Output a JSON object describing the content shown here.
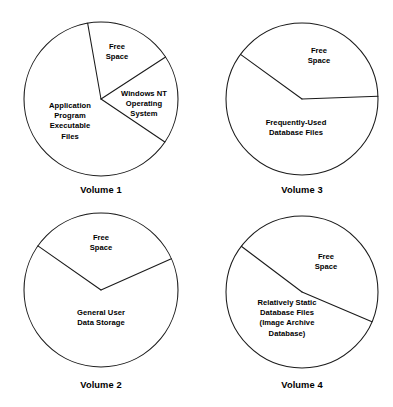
{
  "figure": {
    "title": "",
    "background_color": "#ffffff",
    "line_color": "#1a1a1a",
    "text_color": "#000000"
  },
  "chart_data": {
    "type": "pie",
    "title": "",
    "xlabel": "",
    "ylabel": "",
    "legend_position": "none",
    "grid": false,
    "note": "Four unfilled (outline only) pie charts showing disk volume allocation. Angles measured clockwise from 12 o'clock.",
    "charts": [
      {
        "id": "volume-1",
        "caption": "Volume 1",
        "center": [
          101,
          99
        ],
        "radius": 77,
        "caption_pos": [
          101,
          190
        ],
        "slices": [
          {
            "label": "Free\nSpace",
            "label_lines": [
              "Free",
              "Space"
            ],
            "start_angle_deg": 350,
            "end_angle_deg": 57,
            "percent": 19,
            "label_pos": [
              117,
              52
            ]
          },
          {
            "label": "Windows NT\nOperating\nSystem",
            "label_lines": [
              "Windows NT",
              "Operating",
              "System"
            ],
            "start_angle_deg": 57,
            "end_angle_deg": 124,
            "percent": 19,
            "label_pos": [
              144,
              104
            ]
          },
          {
            "label": "Application\nProgram\nExecutable\nFiles",
            "label_lines": [
              "Application",
              "Program",
              "Executable",
              "Files"
            ],
            "start_angle_deg": 124,
            "end_angle_deg": 350,
            "percent": 62,
            "label_pos": [
              70,
              121
            ]
          }
        ]
      },
      {
        "id": "volume-2",
        "caption": "Volume 2",
        "center": [
          101,
          290
        ],
        "radius": 77,
        "caption_pos": [
          101,
          385
        ],
        "slices": [
          {
            "label": "Free\nSpace",
            "label_lines": [
              "Free",
              "Space"
            ],
            "start_angle_deg": 305,
            "end_angle_deg": 66,
            "percent": 34,
            "label_pos": [
              101,
              243
            ]
          },
          {
            "label": "General User\nData Storage",
            "label_lines": [
              "General User",
              "Data Storage"
            ],
            "start_angle_deg": 66,
            "end_angle_deg": 305,
            "percent": 66,
            "label_pos": [
              101,
              318
            ]
          }
        ]
      },
      {
        "id": "volume-3",
        "caption": "Volume 3",
        "center": [
          302,
          99
        ],
        "radius": 76,
        "caption_pos": [
          302,
          190
        ],
        "slices": [
          {
            "label": "Free\nSpace",
            "label_lines": [
              "Free",
              "Space"
            ],
            "start_angle_deg": 306,
            "end_angle_deg": 88,
            "percent": 39,
            "label_pos": [
              319,
              56
            ]
          },
          {
            "label": "Frequently-Used\nDatabase Files",
            "label_lines": [
              "Frequently-Used",
              "Database Files"
            ],
            "start_angle_deg": 88,
            "end_angle_deg": 306,
            "percent": 61,
            "label_pos": [
              296,
              128
            ]
          }
        ]
      },
      {
        "id": "volume-4",
        "caption": "Volume 4",
        "center": [
          302,
          292
        ],
        "radius": 76,
        "caption_pos": [
          302,
          385
        ],
        "slices": [
          {
            "label": "Free\nSpace",
            "label_lines": [
              "Free",
              "Space"
            ],
            "start_angle_deg": 307,
            "end_angle_deg": 113,
            "percent": 52,
            "label_pos": [
              326,
              262
            ]
          },
          {
            "label": "Relatively Static\nDatabase Files\n(Image Archive\nDatabase)",
            "label_lines": [
              "Relatively Static",
              "Database Files",
              "(Image Archive",
              "Database)"
            ],
            "start_angle_deg": 113,
            "end_angle_deg": 307,
            "percent": 48,
            "label_pos": [
              287,
              318
            ]
          }
        ]
      }
    ]
  }
}
